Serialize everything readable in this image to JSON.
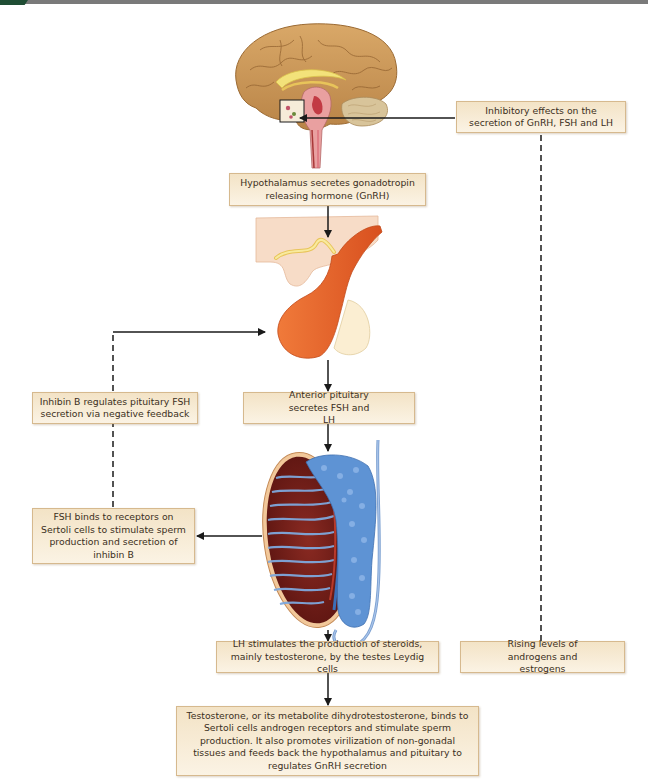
{
  "diagram": {
    "colors": {
      "box_fill_top": "#f3e3c6",
      "box_fill_bottom": "#fbf3e4",
      "box_border": "#d6b98e",
      "line": "#1a1a1a",
      "brain": "#c8955a",
      "pituitary": "#e5632b",
      "testis_tubules": "#5b8fd0",
      "testis_interstitium": "#7a1e1a"
    },
    "illustrations": [
      {
        "id": "brain",
        "label": "Sagittal brain with hypothalamus highlighted"
      },
      {
        "id": "pituitary",
        "label": "Pituitary gland"
      },
      {
        "id": "testis",
        "label": "Testis and epididymis cross-section"
      }
    ],
    "boxes": {
      "inhibitory": "Inhibitory effects on the secretion of GnRH, FSH and LH",
      "hypothalamus": "Hypothalamus secretes gonadotropin releasing hormone (GnRH)",
      "inhibin": "Inhibin B regulates pituitary FSH secretion via negative feedback",
      "anterior_pituitary": "Anterior pituitary secretes FSH and LH",
      "fsh_binds": "FSH binds to receptors on Sertoli cells to stimulate sperm production and secretion of inhibin B",
      "lh_stimulates": "LH stimulates the production of steroids, mainly testosterone, by the testes Leydig cells",
      "rising_levels": "Rising levels of androgens and estrogens",
      "testosterone": "Testosterone, or its metabolite dihydrotestosterone, binds to Sertoli cells androgen receptors and stimulate sperm production. It also promotes virilization of non-gonadal tissues and feeds back the hypothalamus and pituitary to regulates GnRH secretion"
    },
    "connections": [
      {
        "from": "hypothalamus",
        "to": "pituitary",
        "style": "solid-arrow"
      },
      {
        "from": "pituitary",
        "to": "anterior_pituitary",
        "style": "solid-arrow"
      },
      {
        "from": "anterior_pituitary",
        "to": "testis",
        "style": "solid-arrow"
      },
      {
        "from": "testis",
        "to": "fsh_binds",
        "style": "solid-arrow"
      },
      {
        "from": "fsh_binds",
        "to": "inhibin",
        "style": "dashed"
      },
      {
        "from": "inhibin",
        "to": "pituitary",
        "style": "dashed-then-arrow"
      },
      {
        "from": "testis",
        "to": "lh_stimulates",
        "style": "solid"
      },
      {
        "from": "lh_stimulates",
        "to": "testosterone",
        "style": "solid-arrow"
      },
      {
        "from": "rising_levels",
        "to": "inhibitory",
        "style": "dashed"
      },
      {
        "from": "inhibitory",
        "to": "hypothalamus",
        "style": "solid-arrow"
      }
    ]
  }
}
